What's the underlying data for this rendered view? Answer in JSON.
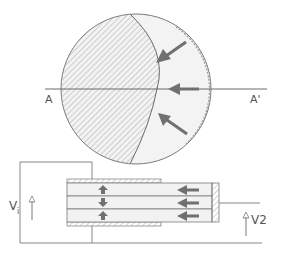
{
  "diagram": {
    "type": "cross-section and layered device schematic",
    "colors": {
      "line": "#6a6a6a",
      "hatch": "#9a9a9a",
      "arrow": "#707070",
      "fill_light": "#f0f0f0",
      "label": "#555555"
    },
    "cross_section": {
      "labels": {
        "left": "A",
        "right": "A'"
      },
      "arrows": [
        {
          "direction": "down-left",
          "label": "upper-pressure-arrow"
        },
        {
          "direction": "left",
          "label": "middle-pressure-arrow"
        },
        {
          "direction": "up-left",
          "label": "lower-pressure-arrow"
        }
      ]
    },
    "layered_device": {
      "layers": 3,
      "layer_arrows": [
        "up",
        "down",
        "up"
      ],
      "flow_arrows": [
        "left",
        "left",
        "left"
      ]
    },
    "circuit": {
      "input_voltage": {
        "label": "V",
        "subscript": "i"
      },
      "output_voltage": {
        "label": "V2"
      }
    }
  }
}
